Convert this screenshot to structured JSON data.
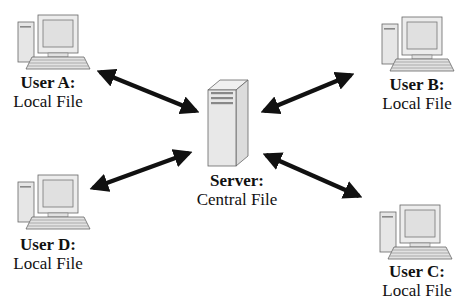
{
  "diagram": {
    "type": "client-server file distribution",
    "colors": {
      "arrow": "#111111",
      "device_fill": "#e8e8e8",
      "device_stroke": "#555555"
    },
    "server": {
      "title": "Server:",
      "subtitle": "Central File",
      "icon": "server-tower-icon"
    },
    "users": [
      {
        "id": "A",
        "title": "User A:",
        "subtitle": "Local File",
        "icon": "desktop-computer-icon"
      },
      {
        "id": "B",
        "title": "User B:",
        "subtitle": "Local File",
        "icon": "desktop-computer-icon"
      },
      {
        "id": "C",
        "title": "User C:",
        "subtitle": "Local File",
        "icon": "desktop-computer-icon"
      },
      {
        "id": "D",
        "title": "User D:",
        "subtitle": "Local File",
        "icon": "desktop-computer-icon"
      }
    ],
    "edges": [
      {
        "from": "User A",
        "to": "Server",
        "direction": "bidirectional"
      },
      {
        "from": "User B",
        "to": "Server",
        "direction": "bidirectional"
      },
      {
        "from": "User C",
        "to": "Server",
        "direction": "bidirectional"
      },
      {
        "from": "User D",
        "to": "Server",
        "direction": "bidirectional"
      }
    ]
  }
}
